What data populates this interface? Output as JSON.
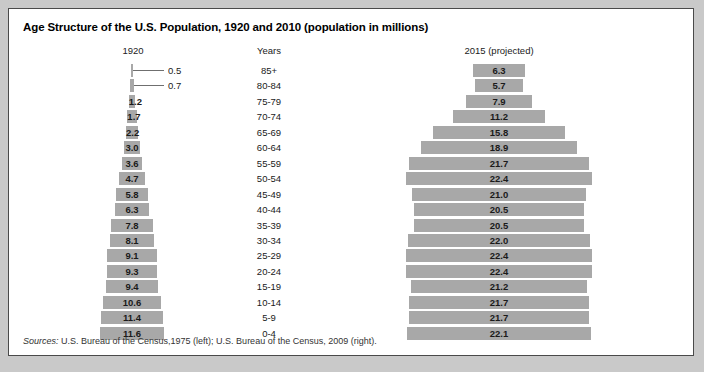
{
  "title": "Age Structure of the U.S. Population, 1920 and 2010 (population in millions)",
  "headings": {
    "left": "1920",
    "center": "Years",
    "right": "2015 (projected)"
  },
  "sources": {
    "label": "Sources:",
    "text": " U.S. Bureau of the Census,1975 (left); U.S. Bureau of the Census, 2009 (right)."
  },
  "colors": {
    "bar": "#a8a8a8",
    "panel": "#ffffff",
    "border": "#4a4a4a",
    "page": "#c9c9c9",
    "text": "#1a1a1a",
    "leader": "#6f6f6f"
  },
  "chart_data": {
    "type": "bar",
    "title": "Age Structure of the U.S. Population, 1920 and 2010 (population in millions)",
    "subtype": "population-pyramid",
    "xlabel": "Population (millions)",
    "ylabel": "Years",
    "grid": false,
    "legend_position": "none",
    "axis_max": 23.0,
    "categories": [
      "85+",
      "80-84",
      "75-79",
      "70-74",
      "65-69",
      "60-64",
      "55-59",
      "50-54",
      "45-49",
      "40-44",
      "35-39",
      "30-34",
      "25-29",
      "20-24",
      "15-19",
      "10-14",
      "5-9",
      "0-4"
    ],
    "series": [
      {
        "name": "1920",
        "values": [
          0.5,
          0.7,
          1.2,
          1.7,
          2.2,
          3.0,
          3.6,
          4.7,
          5.8,
          6.3,
          7.8,
          8.1,
          9.1,
          9.3,
          9.4,
          10.6,
          11.4,
          11.6
        ],
        "labels": [
          "0.5",
          "0.7",
          "1.2",
          "1.7",
          "2.2",
          "3.0",
          "3.6",
          "4.7",
          "5.8",
          "6.3",
          "7.8",
          "8.1",
          "9.1",
          "9.3",
          "9.4",
          "10.6",
          "11.4",
          "11.6"
        ],
        "label_outside": [
          true,
          true,
          false,
          false,
          false,
          false,
          false,
          false,
          false,
          false,
          false,
          false,
          false,
          false,
          false,
          false,
          false,
          false
        ]
      },
      {
        "name": "2015 (projected)",
        "values": [
          6.3,
          5.7,
          7.9,
          11.2,
          15.8,
          18.9,
          21.7,
          22.4,
          21.0,
          20.5,
          20.5,
          22.0,
          22.4,
          22.4,
          21.2,
          21.7,
          21.7,
          22.1
        ],
        "labels": [
          "6.3",
          "5.7",
          "7.9",
          "11.2",
          "15.8",
          "18.9",
          "21.7",
          "22.4",
          "21.0",
          "20.5",
          "20.5",
          "22.0",
          "22.4",
          "22.4",
          "21.2",
          "21.7",
          "21.7",
          "22.1"
        ],
        "label_outside": [
          false,
          false,
          false,
          false,
          false,
          false,
          false,
          false,
          false,
          false,
          false,
          false,
          false,
          false,
          false,
          false,
          false,
          false
        ]
      }
    ]
  }
}
